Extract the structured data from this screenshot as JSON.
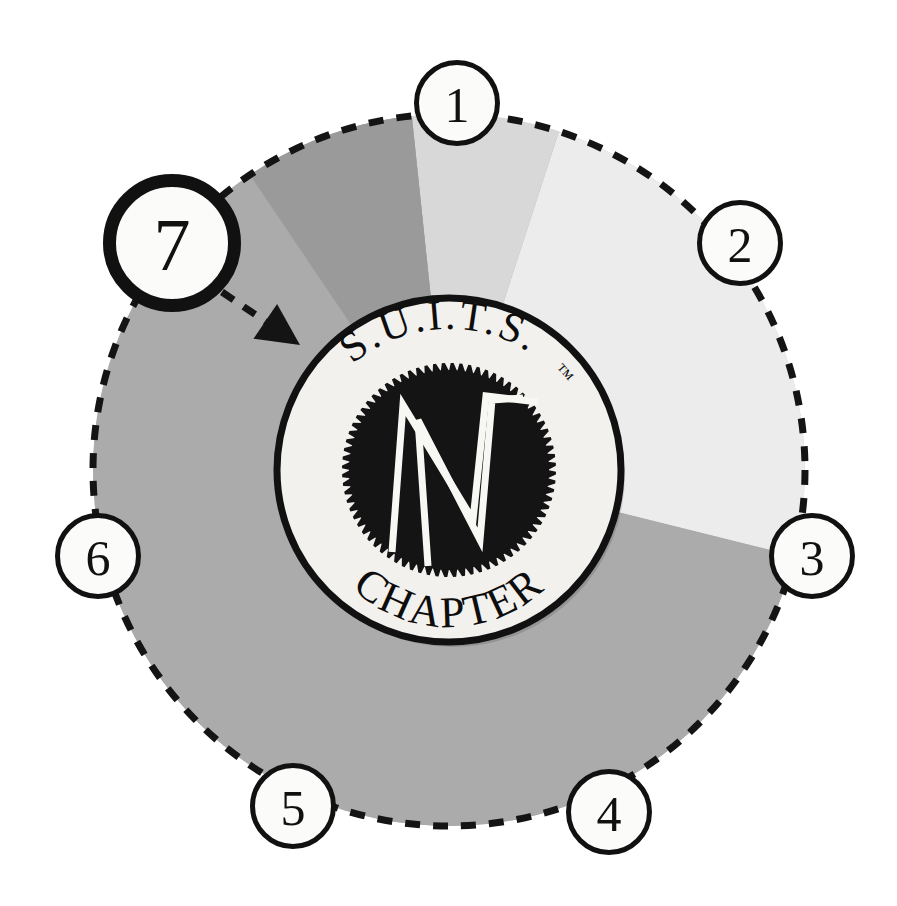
{
  "diagram": {
    "type": "radial-callout-wheel",
    "background_color": "#ffffff",
    "segment_count": 7,
    "active_callout": "7"
  },
  "wheel": {
    "outline_style": "dashed",
    "outline_color": "#141414",
    "center_x": 449,
    "center_y": 470,
    "radius": 356,
    "sectors": [
      {
        "name": "sector-light",
        "color": "#ececec",
        "start_deg": -72,
        "end_deg": 14
      },
      {
        "name": "sector-medium-light",
        "color": "#d8d8d8",
        "start_deg": -96,
        "end_deg": -72
      },
      {
        "name": "sector-medium",
        "color": "#ababab",
        "start_deg": 14,
        "end_deg": 264
      },
      {
        "name": "sector-dark",
        "color": "#9a9a9a",
        "start_deg": -124,
        "end_deg": -96
      }
    ]
  },
  "callouts": [
    {
      "id": "callout-1",
      "label": "1",
      "x": 457,
      "y": 103,
      "r": 43,
      "ring_width": 5,
      "active": false
    },
    {
      "id": "callout-2",
      "label": "2",
      "x": 740,
      "y": 243,
      "r": 43,
      "ring_width": 5,
      "active": false
    },
    {
      "id": "callout-3",
      "label": "3",
      "x": 812,
      "y": 556,
      "r": 43,
      "ring_width": 5,
      "active": false
    },
    {
      "id": "callout-4",
      "label": "4",
      "x": 609,
      "y": 812,
      "r": 43,
      "ring_width": 5,
      "active": false
    },
    {
      "id": "callout-5",
      "label": "5",
      "x": 293,
      "y": 806,
      "r": 43,
      "ring_width": 5,
      "active": false
    },
    {
      "id": "callout-6",
      "label": "6",
      "x": 98,
      "y": 556,
      "r": 43,
      "ring_width": 5,
      "active": false
    },
    {
      "id": "callout-7",
      "label": "7",
      "x": 172,
      "y": 243,
      "r": 69,
      "ring_width": 13,
      "active": true
    }
  ],
  "leader": {
    "name": "leader-line-callout-7",
    "style": "dashed",
    "color": "#141414",
    "from_x": 222,
    "from_y": 292,
    "to_x": 300,
    "to_y": 345,
    "arrowhead": "solid-triangle"
  },
  "emblem": {
    "name": "suits-chapter-emblem",
    "center_x": 449,
    "center_y": 470,
    "outer_radius": 172,
    "rim_color": "#111111",
    "face_color": "#f2f1ee",
    "top_text": "S.U.I.T.S.",
    "trademark": "™",
    "bottom_text": "CHAPTER",
    "inner_disc": {
      "name": "gear-disc",
      "radius": 104,
      "color": "#141414",
      "edge": "toothed"
    },
    "monogram": {
      "name": "zigzag-monogram",
      "stroke_color": "#f7f7f4",
      "description": "overlapping M and W zigzag"
    }
  }
}
